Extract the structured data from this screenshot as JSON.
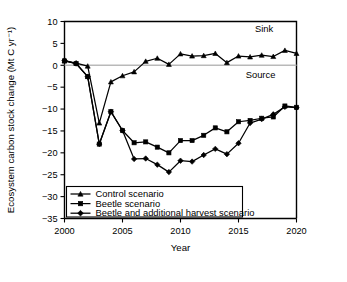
{
  "chart_data": {
    "type": "line",
    "title": "",
    "xlabel": "Year",
    "ylabel": "Ecosystem carbon stock change (Mt C yr⁻¹)",
    "xlim": [
      2000,
      2020
    ],
    "ylim": [
      -35,
      10
    ],
    "xticks": [
      2000,
      2005,
      2010,
      2015,
      2020
    ],
    "xtick_labels": [
      "2000",
      "2005",
      "2010",
      "2015",
      "2020"
    ],
    "yticks": [
      10,
      5,
      0,
      -5,
      -10,
      -15,
      -20,
      -25,
      -30,
      -35
    ],
    "ytick_labels": [
      "10",
      "5",
      "0",
      "−5",
      "−10",
      "−15",
      "−20",
      "−25",
      "−30",
      "−35"
    ],
    "grid": false,
    "zero_reference_line": 0,
    "legend_position": "lower-left",
    "annotations": [
      {
        "text": "Sink",
        "x": 2017.2,
        "y": 7.6
      },
      {
        "text": "Source",
        "x": 2016.9,
        "y": -3.0
      }
    ],
    "x": [
      2000,
      2001,
      2002,
      2003,
      2004,
      2005,
      2006,
      2007,
      2008,
      2009,
      2010,
      2011,
      2012,
      2013,
      2014,
      2015,
      2016,
      2017,
      2018,
      2019,
      2020
    ],
    "series": [
      {
        "name": "Control scenario",
        "marker": "triangle",
        "values": [
          1.0,
          0.5,
          -0.2,
          -13.2,
          -3.8,
          -2.4,
          -1.5,
          0.9,
          1.6,
          0.2,
          2.6,
          2.1,
          2.2,
          2.7,
          0.6,
          2.1,
          1.9,
          2.3,
          2.0,
          3.4,
          2.7
        ]
      },
      {
        "name": "Beetle scenario",
        "marker": "square",
        "values": [
          1.0,
          0.4,
          -2.6,
          -18.0,
          -10.6,
          -14.9,
          -17.7,
          -17.5,
          -18.7,
          -20.0,
          -17.2,
          -17.2,
          -16.0,
          -14.3,
          -15.2,
          -12.9,
          -12.6,
          -12.1,
          -11.8,
          -9.3,
          -9.6
        ]
      },
      {
        "name": "Beetle and additional harvest scenario",
        "marker": "diamond",
        "values": [
          1.1,
          0.4,
          -2.6,
          -18.0,
          -10.6,
          -14.9,
          -21.4,
          -21.3,
          -22.7,
          -24.4,
          -21.8,
          -22.0,
          -20.5,
          -19.1,
          -20.3,
          -17.8,
          -13.2,
          -12.3,
          -11.2,
          -9.5,
          -9.7
        ]
      }
    ],
    "legend_entries": [
      {
        "label": "Control scenario",
        "marker": "triangle"
      },
      {
        "label": "Beetle scenario",
        "marker": "square"
      },
      {
        "label": "Beetle and additional harvest scenario",
        "marker": "diamond"
      }
    ]
  }
}
